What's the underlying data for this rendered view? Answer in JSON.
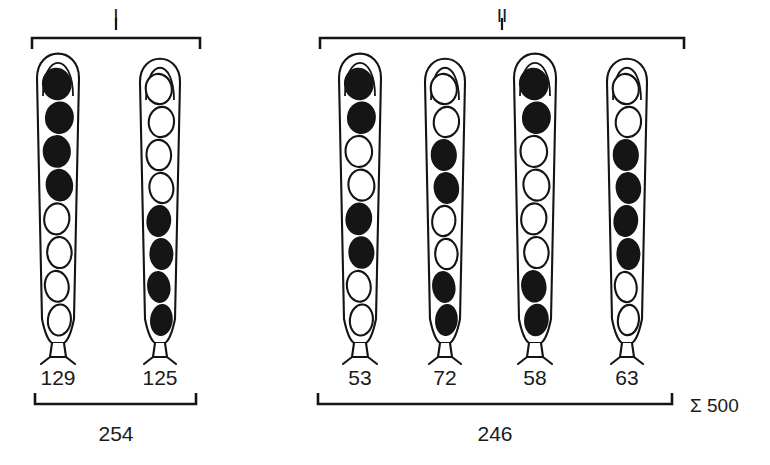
{
  "figure": {
    "background_color": "#ffffff",
    "ink_color": "#141414",
    "spore_dark_color": "#151515",
    "spore_light_color": "#ffffff",
    "grand_total_label": "Σ 500"
  },
  "groups": [
    {
      "id": "group-I",
      "label": "I",
      "total": "254",
      "bracket": {
        "x1": 32,
        "x2": 200,
        "y": 38,
        "arm": 11
      },
      "bottom_bracket": {
        "x1": 35,
        "x2": 196,
        "y": 404,
        "arm": 11
      },
      "label_x": 116,
      "label_y": 22,
      "total_x": 116,
      "total_y": 441
    },
    {
      "id": "group-II",
      "label": "II",
      "total": "246",
      "bracket": {
        "x1": 320,
        "x2": 684,
        "y": 38,
        "arm": 11
      },
      "bottom_bracket": {
        "x1": 318,
        "x2": 672,
        "y": 404,
        "arm": 11
      },
      "label_x": 502,
      "label_y": 22,
      "total_x": 495,
      "total_y": 441
    }
  ],
  "asci": [
    {
      "id": "ascus-1",
      "group": "I",
      "count": "129",
      "center_x": 58,
      "label_x": 58,
      "label_y": 385,
      "width": 42,
      "top_y": 57,
      "bottom_y": 345,
      "spores": [
        "dark",
        "dark",
        "dark",
        "dark",
        "light",
        "light",
        "light",
        "light"
      ]
    },
    {
      "id": "ascus-2",
      "group": "I",
      "count": "125",
      "center_x": 160,
      "label_x": 160,
      "label_y": 385,
      "width": 40,
      "top_y": 62,
      "bottom_y": 345,
      "spores": [
        "light",
        "light",
        "light",
        "light",
        "dark",
        "dark",
        "dark",
        "dark"
      ]
    },
    {
      "id": "ascus-3",
      "group": "II",
      "count": "53",
      "center_x": 360,
      "label_x": 360,
      "label_y": 385,
      "width": 42,
      "top_y": 57,
      "bottom_y": 345,
      "spores": [
        "dark",
        "dark",
        "light",
        "light",
        "dark",
        "dark",
        "light",
        "light"
      ]
    },
    {
      "id": "ascus-4",
      "group": "II",
      "count": "72",
      "center_x": 445,
      "label_x": 445,
      "label_y": 385,
      "width": 40,
      "top_y": 62,
      "bottom_y": 345,
      "spores": [
        "light",
        "light",
        "dark",
        "dark",
        "light",
        "light",
        "dark",
        "dark"
      ]
    },
    {
      "id": "ascus-5",
      "group": "II",
      "count": "58",
      "center_x": 535,
      "label_x": 535,
      "label_y": 385,
      "width": 42,
      "top_y": 57,
      "bottom_y": 345,
      "spores": [
        "dark",
        "dark",
        "light",
        "light",
        "light",
        "light",
        "dark",
        "dark"
      ]
    },
    {
      "id": "ascus-6",
      "group": "II",
      "count": "63",
      "center_x": 627,
      "label_x": 627,
      "label_y": 385,
      "width": 40,
      "top_y": 62,
      "bottom_y": 345,
      "spores": [
        "light",
        "light",
        "dark",
        "dark",
        "dark",
        "dark",
        "light",
        "light"
      ]
    }
  ],
  "sum": {
    "text": "Σ 500",
    "x": 690,
    "y": 412
  }
}
